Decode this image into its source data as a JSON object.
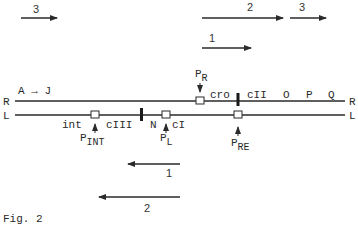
{
  "figure": {
    "caption": "Fig. 2",
    "colors": {
      "ink": "#2a2a2a",
      "background": "#ffffff"
    }
  },
  "strands": {
    "upper": {
      "left_label": "R",
      "right_label": "R",
      "gene_span_label": "A → J"
    },
    "lower": {
      "left_label": "L",
      "right_label": "L"
    }
  },
  "upper_genes": [
    "cro",
    "cII",
    "O",
    "P",
    "Q"
  ],
  "lower_genes": [
    "int",
    "cIII",
    "N",
    "cI"
  ],
  "promoters": {
    "pr": {
      "main": "P",
      "sub": "R"
    },
    "pint": {
      "main": "P",
      "sub": "INT"
    },
    "pl": {
      "main": "P",
      "sub": "L"
    },
    "pre": {
      "main": "P",
      "sub": "RE"
    }
  },
  "transcripts": {
    "top_left_3": {
      "label": "3",
      "direction": "right"
    },
    "top_2": {
      "label": "2",
      "direction": "right"
    },
    "top_right_3": {
      "label": "3",
      "direction": "right"
    },
    "top_1": {
      "label": "1",
      "direction": "right"
    },
    "bottom_1": {
      "label": "1",
      "direction": "left"
    },
    "bottom_2": {
      "label": "2",
      "direction": "left"
    }
  }
}
